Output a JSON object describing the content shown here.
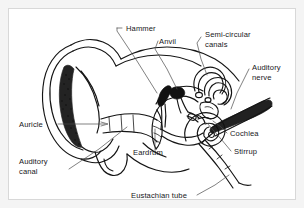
{
  "figure": {
    "kind": "labeled anatomical line diagram",
    "background_color": "#ffffff",
    "frame_color": "#d8d8d8",
    "ink_color": "#141414",
    "leader_color": "#4a4a4a"
  },
  "labels": {
    "hammer": "Hammer",
    "anvil": "Anvil",
    "semicircular_line1": "Semi-circular",
    "semicircular_line2": "canals",
    "auditory_nerve_line1": "Auditory",
    "auditory_nerve_line2": "nerve",
    "cochlea": "Cochlea",
    "stirrup": "Stirrup",
    "auricle": "Auricle",
    "auditory_canal_line1": "Auditory",
    "auditory_canal_line2": "canal",
    "eardrum": "Eardrum",
    "eustachian_tube": "Eustachian tube"
  },
  "parts": [
    {
      "id": "hammer",
      "name": "Hammer",
      "region": "middle ear",
      "label_x": 118,
      "label_y": 22
    },
    {
      "id": "anvil",
      "name": "Anvil",
      "region": "middle ear",
      "label_x": 152,
      "label_y": 36
    },
    {
      "id": "semicircular-canals",
      "name": "Semi-circular canals",
      "region": "inner ear",
      "label_x": 203,
      "label_y": 30
    },
    {
      "id": "auditory-nerve",
      "name": "Auditory nerve",
      "region": "inner ear",
      "label_x": 248,
      "label_y": 70
    },
    {
      "id": "cochlea",
      "name": "Cochlea",
      "region": "inner ear",
      "label_x": 222,
      "label_y": 129
    },
    {
      "id": "stirrup",
      "name": "Stirrup",
      "region": "middle ear",
      "label_x": 226,
      "label_y": 147
    },
    {
      "id": "auricle",
      "name": "Auricle",
      "region": "outer ear",
      "label_x": 14,
      "label_y": 120
    },
    {
      "id": "auditory-canal",
      "name": "Auditory canal",
      "region": "outer ear",
      "label_x": 14,
      "label_y": 158
    },
    {
      "id": "eardrum",
      "name": "Eardrum",
      "region": "middle ear",
      "label_x": 128,
      "label_y": 149
    },
    {
      "id": "eustachian-tube",
      "name": "Eustachian tube",
      "region": "middle ear",
      "label_x": 137,
      "label_y": 190
    }
  ]
}
